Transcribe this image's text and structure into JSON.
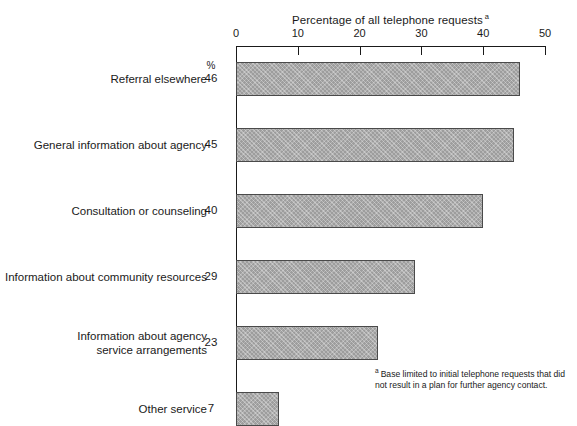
{
  "chart_data": {
    "type": "bar",
    "orientation": "horizontal",
    "title": "Percentage of all telephone requests",
    "title_superscript": "a",
    "xlabel": "",
    "ylabel": "",
    "xlim": [
      0,
      50
    ],
    "xticks": [
      0,
      10,
      20,
      30,
      40,
      50
    ],
    "xtick_labels": [
      "0",
      "10",
      "20",
      "30",
      "40",
      "50"
    ],
    "grid": false,
    "legend": null,
    "value_header": "%",
    "categories": [
      "Referral elsewhere",
      "General information about agency",
      "Consultation or counseling",
      "Information about community resources",
      "Information about agency\nservice arrangements",
      "Other service"
    ],
    "values": [
      46,
      45,
      40,
      29,
      23,
      7
    ],
    "value_labels": [
      "46",
      "45",
      "40",
      "29",
      "23",
      "7"
    ],
    "annotations": {
      "footnote_marker": "a",
      "footnote_text": "Base limited to initial telephone requests that did not result in a plan for further agency contact."
    },
    "colors": {
      "bar_fill": "#9d9d9d",
      "bar_border": "#4a4a4a",
      "axis": "#1a1a1a",
      "text": "#1a1a1a",
      "background": "#ffffff"
    }
  }
}
